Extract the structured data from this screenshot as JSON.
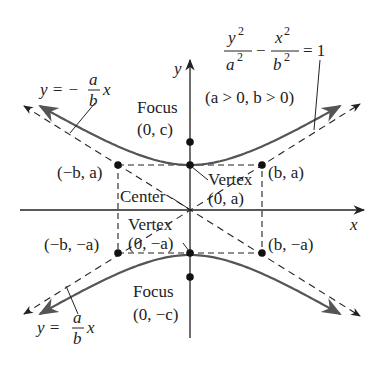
{
  "figure": {
    "equation": {
      "lhs_num1": "y",
      "lhs_den1": "a",
      "exp": "2",
      "minus": "−",
      "lhs_num2": "x",
      "lhs_den2": "b",
      "rhs": "= 1"
    },
    "condition": "(a > 0, b > 0)",
    "axes": {
      "x_label": "x",
      "y_label": "y"
    },
    "asymptote_neg": {
      "prefix": "y = −",
      "num": "a",
      "den": "b",
      "suffix": "x"
    },
    "asymptote_pos": {
      "prefix": "y = ",
      "num": "a",
      "den": "b",
      "suffix": "x"
    },
    "focus_top": {
      "label": "Focus",
      "coords": "(0, c)"
    },
    "focus_bottom": {
      "label": "Focus",
      "coords": "(0, −c)"
    },
    "vertex_top": {
      "label": "Vertex",
      "coords": "(0, a)"
    },
    "vertex_bottom": {
      "label": "Vertex",
      "coords": "(0, −a)"
    },
    "center": {
      "label": "Center"
    },
    "corners": {
      "top_left": "(−b, a)",
      "top_right": "(b, a)",
      "bottom_left": "(−b, −a)",
      "bottom_right": "(b, −a)"
    },
    "colors": {
      "curve": "#555555",
      "ink": "#222222"
    }
  }
}
